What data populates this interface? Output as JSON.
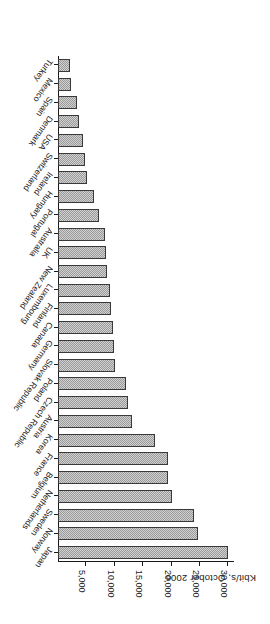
{
  "chart_data": {
    "type": "bar",
    "orientation": "horizontal",
    "title": "Kbit/s, October 2006",
    "xlabel": "",
    "ylabel": "Kbit/s, October 2006",
    "grid": false,
    "legend": null,
    "rotation_note": "figure is printed rotated 180 degrees",
    "value_axis": {
      "min": 0,
      "max": 31000,
      "tick_values": [
        5000,
        10000,
        15000,
        20000,
        25000,
        30000
      ],
      "tick_labels": [
        "5,000",
        "10,000",
        "15,000",
        "20,000",
        "25,000",
        "30,000"
      ]
    },
    "categories": [
      "Japan",
      "Norway",
      "Sweden",
      "Netherlands",
      "Belgium",
      "France",
      "Korea",
      "Austria",
      "Czech Republic",
      "Poland",
      "Slovak Republic",
      "Germany",
      "Canada",
      "Finland",
      "Luxembourg",
      "New Zealand",
      "UK",
      "Australia",
      "Portugal",
      "Hungary",
      "Ireland",
      "Switzerland",
      "USA",
      "Denmark",
      "Spain",
      "Mexico",
      "Turkey"
    ],
    "values": [
      30000,
      24700,
      24000,
      20100,
      19400,
      19300,
      17000,
      13000,
      12300,
      11900,
      10100,
      9900,
      9700,
      9400,
      9200,
      8700,
      8400,
      8300,
      7300,
      6400,
      5100,
      4700,
      4400,
      3700,
      3400,
      2250,
      2200
    ],
    "units": "Kbit/s"
  }
}
